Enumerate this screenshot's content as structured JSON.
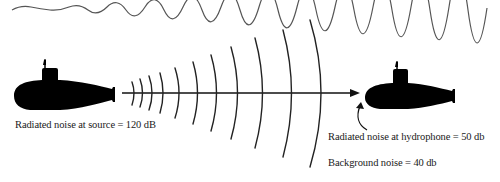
{
  "diagram": {
    "elements": {
      "sea_surface": "wavy line",
      "source_submarine": "submarine silhouette (left)",
      "receiver_submarine": "submarine silhouette (right)",
      "sound_waves": "concentric arcs expanding from source",
      "propagation_arrow": "arrow from source to receiver"
    },
    "labels": {
      "source": "Radiated noise at source = 120 dB",
      "hydrophone": "Radiated noise at hydrophone = 50 db",
      "background": "Background noise = 40 db"
    },
    "colors": {
      "ink": "#000000",
      "text": "#1a1a1a",
      "surface_line": "#555555",
      "background": "#ffffff"
    }
  }
}
